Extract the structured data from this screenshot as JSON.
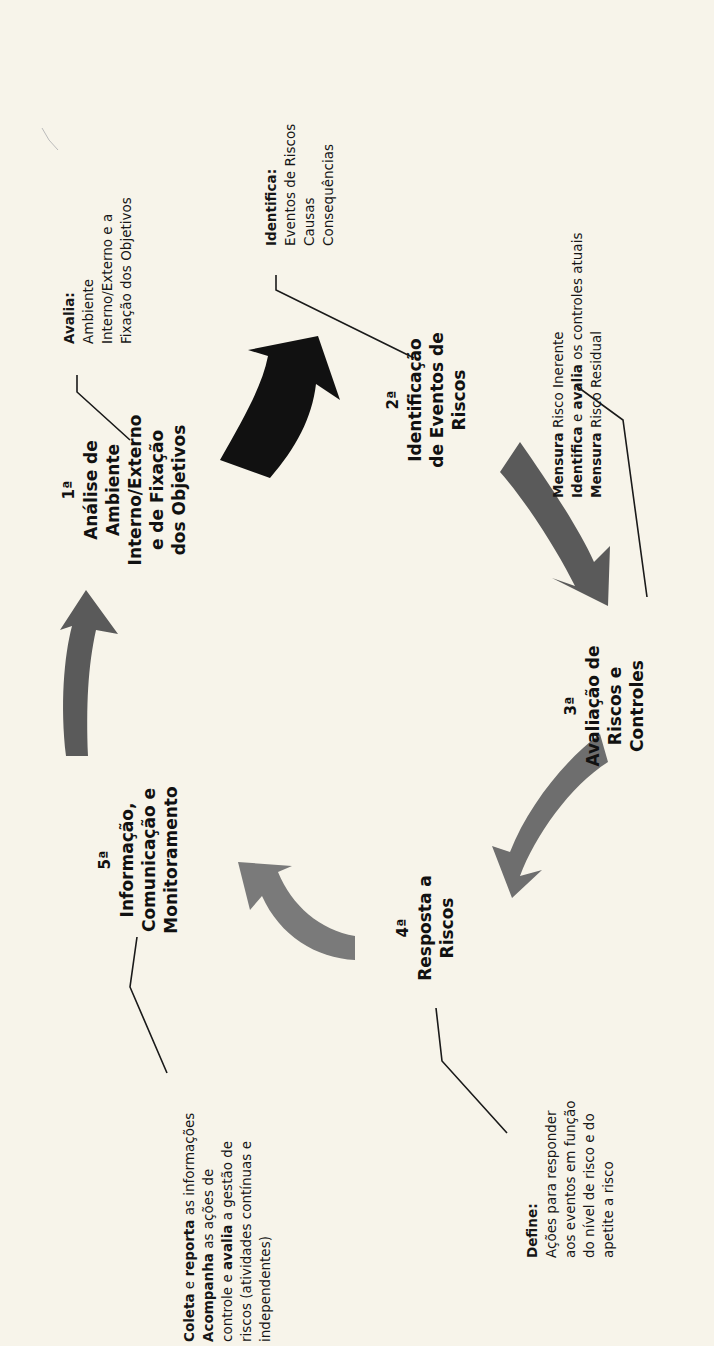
{
  "diagram": {
    "colors": {
      "background": "#f7f4ea",
      "arrow_dark": "#111111",
      "arrow_mid": "#5a5a5a",
      "arrow_gray": "#6e6e6e",
      "arrow_light": "#808080",
      "text": "#111111"
    },
    "steps": [
      {
        "num": "1ª",
        "lines": [
          "Análise de",
          "Ambiente",
          "Interno/Externo",
          "e de Fixação",
          "dos Objetivos"
        ]
      },
      {
        "num": "2ª",
        "lines": [
          "Identificação",
          "de Eventos de",
          "Riscos"
        ]
      },
      {
        "num": "3ª",
        "lines": [
          "Avaliação de",
          "Riscos e",
          "Controles"
        ]
      },
      {
        "num": "4ª",
        "lines": [
          "Resposta a",
          "Riscos"
        ]
      },
      {
        "num": "5ª",
        "lines": [
          "Informação,",
          "Comunicação e",
          "Monitoramento"
        ]
      }
    ],
    "notes": {
      "step1": {
        "title": "Avalia:",
        "lines": [
          "Ambiente",
          "Interno/Externo  e a",
          "Fixação dos Objetivos"
        ]
      },
      "step2": {
        "title": "Identifica:",
        "lines": [
          "Eventos  de  Riscos",
          "Causas",
          "Consequências"
        ]
      },
      "step3": {
        "rows": [
          {
            "bold": "Mensura",
            "rest": " Risco Inerente"
          },
          {
            "bold": "Identifica",
            "mid": " e ",
            "bold2": "avalia",
            "rest": " os controles atuais"
          },
          {
            "bold": "Mensura",
            "rest": " Risco Residual"
          }
        ]
      },
      "step4": {
        "title": "Define:",
        "lines": [
          "Ações para responder",
          "aos eventos em função",
          "do nível de risco e do",
          "apetite a risco"
        ]
      },
      "step5": {
        "rows": [
          {
            "bold": "Coleta",
            "mid": " e ",
            "bold2": "reporta",
            "rest": " as informações"
          },
          {
            "bold": "Acompanha",
            "rest": "  as ações de"
          },
          {
            "plain": "controle e ",
            "bold": "avalia",
            "rest": " a gestão de"
          },
          {
            "plain": "riscos (atividades  contínuas e"
          },
          {
            "plain": "independentes)"
          }
        ]
      }
    }
  }
}
